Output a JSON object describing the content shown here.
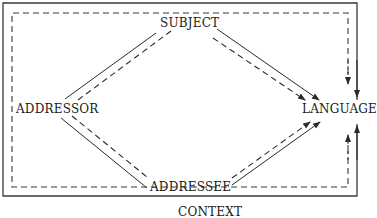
{
  "diagram": {
    "nodes": {
      "subject": "SUBJECT",
      "addressor": "ADDRESSOR",
      "language": "LANGUAGE",
      "addressee": "ADDRESSEE",
      "context": "CONTEXT"
    },
    "edges": [
      {
        "from": "ADDRESSOR",
        "to": "SUBJECT",
        "style": "solid"
      },
      {
        "from": "ADDRESSOR",
        "to": "SUBJECT",
        "style": "dashed"
      },
      {
        "from": "SUBJECT",
        "to": "LANGUAGE",
        "style": "solid",
        "arrow": true
      },
      {
        "from": "SUBJECT",
        "to": "LANGUAGE",
        "style": "dashed",
        "arrow": true
      },
      {
        "from": "ADDRESSOR",
        "to": "ADDRESSEE",
        "style": "solid"
      },
      {
        "from": "ADDRESSOR",
        "to": "ADDRESSEE",
        "style": "dashed"
      },
      {
        "from": "ADDRESSEE",
        "to": "LANGUAGE",
        "style": "solid",
        "arrow": true
      },
      {
        "from": "ADDRESSEE",
        "to": "LANGUAGE",
        "style": "dashed",
        "arrow": true
      },
      {
        "from": "CONTEXT",
        "to": "LANGUAGE",
        "style": "solid",
        "arrow": true,
        "note": "outer frame"
      },
      {
        "from": "CONTEXT",
        "to": "LANGUAGE",
        "style": "dashed",
        "arrow": true,
        "note": "inner frame"
      }
    ],
    "colors": {
      "line": "#2a2a2a",
      "text": "#1a1a1a",
      "background": "#ffffff"
    }
  }
}
